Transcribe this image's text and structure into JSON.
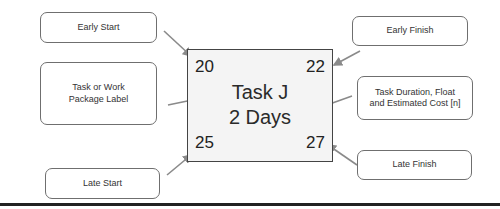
{
  "diagram": {
    "type": "activity-on-node legend",
    "node": {
      "early_start": "20",
      "early_finish": "22",
      "task_label": "Task J",
      "duration": "2 Days",
      "late_start": "25",
      "late_finish": "27"
    },
    "callouts": {
      "early_start": "Early Start",
      "task_label_line1": "Task or Work",
      "task_label_line2": "Package Label",
      "late_start": "Late Start",
      "early_finish": "Early Finish",
      "duration_line1": "Task Duration, Float",
      "duration_line2": "and Estimated Cost [n]",
      "late_finish": "Late Finish"
    },
    "colors": {
      "arrow": "#8a8a8a",
      "node_border": "#444444",
      "node_fill": "#f4f4f4",
      "callout_border": "#6f6f6f",
      "rule": "#222222"
    }
  }
}
